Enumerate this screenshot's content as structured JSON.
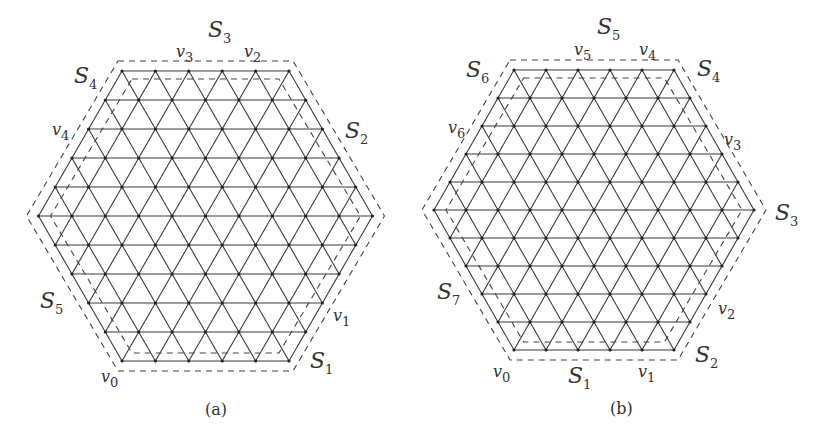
{
  "figure": {
    "panels": [
      {
        "id": "a",
        "caption": "(a)",
        "caption_pos": [
          205,
          415
        ],
        "lattice": {
          "side_vertices": 6,
          "top_left": [
            122,
            71
          ],
          "dx": 33.4,
          "dy": 29
        },
        "sides": [
          {
            "label": "S",
            "sub": "1",
            "pos": [
              310,
              368
            ]
          },
          {
            "label": "S",
            "sub": "2",
            "pos": [
              345,
              138
            ]
          },
          {
            "label": "S",
            "sub": "3",
            "pos": [
              208,
              37
            ]
          },
          {
            "label": "S",
            "sub": "4",
            "pos": [
              74,
              83
            ]
          },
          {
            "label": "S",
            "sub": "5",
            "pos": [
              40,
              308
            ]
          }
        ],
        "vertices": [
          {
            "label": "v",
            "sub": "0",
            "pos": [
              101,
              382
            ]
          },
          {
            "label": "v",
            "sub": "1",
            "pos": [
              333,
              321
            ]
          },
          {
            "label": "v",
            "sub": "2",
            "pos": [
              244,
              57
            ]
          },
          {
            "label": "v",
            "sub": "3",
            "pos": [
              176,
              57
            ]
          },
          {
            "label": "v",
            "sub": "4",
            "pos": [
              52,
              135
            ]
          }
        ]
      },
      {
        "id": "b",
        "caption": "(b)",
        "caption_pos": [
          610,
          414
        ],
        "lattice": {
          "side_vertices": 6,
          "top_left": [
            514,
            70
          ],
          "dx": 32,
          "dy": 28
        },
        "sides": [
          {
            "label": "S",
            "sub": "1",
            "pos": [
              568,
              383
            ]
          },
          {
            "label": "S",
            "sub": "2",
            "pos": [
              695,
              362
            ]
          },
          {
            "label": "S",
            "sub": "3",
            "pos": [
              775,
              220
            ]
          },
          {
            "label": "S",
            "sub": "4",
            "pos": [
              697,
              76
            ]
          },
          {
            "label": "S",
            "sub": "5",
            "pos": [
              597,
              34
            ]
          },
          {
            "label": "S",
            "sub": "6",
            "pos": [
              466,
              77
            ]
          },
          {
            "label": "S",
            "sub": "7",
            "pos": [
              437,
              299
            ]
          }
        ],
        "vertices": [
          {
            "label": "v",
            "sub": "0",
            "pos": [
              493,
              377
            ]
          },
          {
            "label": "v",
            "sub": "1",
            "pos": [
              638,
              377
            ]
          },
          {
            "label": "v",
            "sub": "2",
            "pos": [
              718,
              314
            ]
          },
          {
            "label": "v",
            "sub": "3",
            "pos": [
              724,
              145
            ]
          },
          {
            "label": "v",
            "sub": "4",
            "pos": [
              639,
              55
            ]
          },
          {
            "label": "v",
            "sub": "5",
            "pos": [
              574,
              55
            ]
          },
          {
            "label": "v",
            "sub": "6",
            "pos": [
              448,
              133
            ]
          }
        ]
      }
    ]
  }
}
